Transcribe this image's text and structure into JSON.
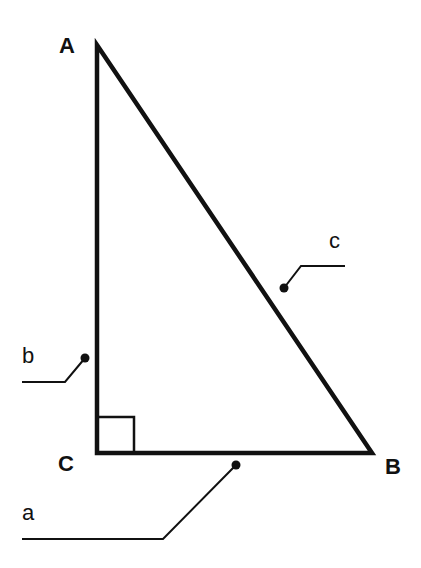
{
  "diagram": {
    "type": "right-triangle",
    "stroke_color": "#111111",
    "background": "#ffffff",
    "vertices": {
      "A": {
        "label": "A",
        "x": 97,
        "y": 45
      },
      "B": {
        "label": "B",
        "x": 372,
        "y": 453
      },
      "C": {
        "label": "C",
        "x": 97,
        "y": 453
      }
    },
    "right_angle_at": "C",
    "sides": {
      "a": {
        "label": "a",
        "between": "C-B"
      },
      "b": {
        "label": "b",
        "between": "A-C"
      },
      "c": {
        "label": "c",
        "between": "A-B"
      }
    }
  }
}
